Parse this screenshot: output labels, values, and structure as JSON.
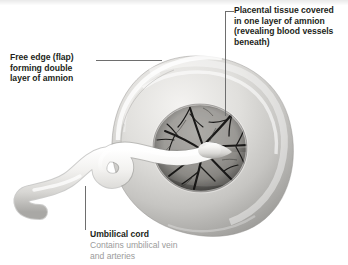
{
  "figure": {
    "background_color": "#ffffff",
    "text_color": "#231f20",
    "subtext_color": "#9b9b9b",
    "leader_line_color": "#6e6e6e"
  },
  "labels": {
    "placental_tissue": "Placental tissue covered\nin one layer of amnion\n(revealing blood vessels\nbeneath)",
    "free_edge": "Free edge (flap)\nforming double\nlayer of amnion",
    "umbilical_cord_title": "Umbilical cord",
    "umbilical_cord_sub": "Contains umbilical vein\nand arteries"
  },
  "anatomy": {
    "parts": [
      "placental disc",
      "amnion membrane ring",
      "chorionic plate blood vessels",
      "umbilical cord",
      "cord insertion site"
    ]
  }
}
